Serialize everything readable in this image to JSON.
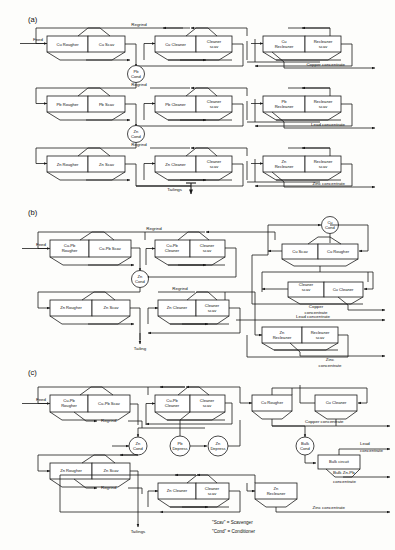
{
  "figure": {
    "panels": [
      {
        "id": "a",
        "label": "(a)"
      },
      {
        "id": "b",
        "label": "(b)"
      },
      {
        "id": "c",
        "label": "(c)"
      }
    ],
    "legend": [
      {
        "term": "\"Scav\" = Scavenger"
      },
      {
        "term": "\"Cond\" = Conditioner"
      }
    ]
  },
  "panel_a": {
    "label": "(a)",
    "feed": "Feed",
    "rows": [
      {
        "regrind": "Regrind",
        "rougher": "Cu Rougher",
        "scav": "Cu Scav",
        "cleaner": "Cu Cleaner",
        "cleaner_scav_l1": "Cleaner",
        "cleaner_scav_l2": "scav",
        "recleaner_l1": "Cu",
        "recleaner_l2": "Recleaner",
        "recleaner_scav_l1": "Recleaner",
        "recleaner_scav_l2": "scav",
        "product": "Copper concentrate",
        "conditioner_l1": "Pb",
        "conditioner_l2": "Cond"
      },
      {
        "regrind": "Regrind",
        "rougher": "Pb Rougher",
        "scav": "Pb Scav",
        "cleaner": "Pb Cleaner",
        "cleaner_scav_l1": "Cleaner",
        "cleaner_scav_l2": "scav",
        "recleaner_l1": "Pb",
        "recleaner_l2": "Recleaner",
        "recleaner_scav_l1": "Recleaner",
        "recleaner_scav_l2": "scav",
        "product": "Lead concentrate",
        "conditioner_l1": "Zn",
        "conditioner_l2": "Cond"
      },
      {
        "regrind": "Regrind",
        "rougher": "Zn Rougher",
        "scav": "Zn Scav",
        "cleaner": "Zn Cleaner",
        "cleaner_scav_l1": "Cleaner",
        "cleaner_scav_l2": "scav",
        "recleaner_l1": "Zn",
        "recleaner_l2": "Recleaner",
        "recleaner_scav_l1": "Recleaner",
        "recleaner_scav_l2": "scav",
        "product": "Zinc concentrate",
        "conditioner_l1": "",
        "conditioner_l2": ""
      }
    ],
    "tailings": "Tailings"
  },
  "panel_b": {
    "label": "(b)",
    "feed": "Feed",
    "regrind_top": "Regrind",
    "regrind_mid": "Regrind",
    "bulk_rougher_l1": "Cu-Pb",
    "bulk_rougher_l2": "Rougher",
    "bulk_scav": "Cu-Pb Scav",
    "bulk_cleaner_l1": "Cu-Pb",
    "bulk_cleaner_l2": "Cleaner",
    "bulk_cleaner_scav_l1": "Cleaner",
    "bulk_cleaner_scav_l2": "scav",
    "zn_cond_l1": "Zn",
    "zn_cond_l2": "Cond",
    "cu_cond_l1": "Cu",
    "cu_cond_l2": "Cond",
    "cu_scav": "Cu Scav",
    "cu_rougher": "Cu Rougher",
    "cu_cleaner_scav_l1": "Cleaner",
    "cu_cleaner_scav_l2": "scav",
    "cu_cleaner": "Cu Cleaner",
    "copper_conc_l1": "Copper",
    "copper_conc_l2": "concentrate",
    "lead_conc": "Lead concentrate",
    "zn_rougher": "Zn Rougher",
    "zn_scav": "Zn Scav",
    "zn_cleaner": "Zn Cleaner",
    "zn_cleaner_scav_l1": "Cleaner",
    "zn_cleaner_scav_l2": "scav",
    "zn_recleaner_l1": "Zn",
    "zn_recleaner_l2": "Recleaner",
    "zn_recleaner_scav_l1": "Recleaner",
    "zn_recleaner_scav_l2": "scav",
    "zinc_conc_l1": "Zinc",
    "zinc_conc_l2": "concentrate",
    "tailing": "Tailing"
  },
  "panel_c": {
    "label": "(c)",
    "feed": "Feed",
    "bulk_rougher_l1": "Cu-Pb",
    "bulk_rougher_l2": "Rougher",
    "bulk_scav": "Cu-Pb Scav",
    "regrind_top": "Regrind",
    "bulk_cleaner_l1": "Cu-Pb",
    "bulk_cleaner_l2": "Cleaner",
    "bulk_cleaner_scav_l1": "Cleaner",
    "bulk_cleaner_scav_l2": "scav",
    "cu_rougher": "Cu Rougher",
    "cu_cleaner": "Cu Cleaner",
    "zn_cond_l1": "Zn",
    "zn_cond_l2": "Cond",
    "pb_depress_l1": "Pb",
    "pb_depress_l2": "Depress",
    "zn_depress_l1": "Zn",
    "zn_depress_l2": "Depress",
    "bulk_cond_l1": "Bulk",
    "bulk_cond_l2": "Cond",
    "bulk_circuit": "Bulk circuit",
    "copper_conc": "Copper concentrate",
    "lead_conc_l1": "Lead",
    "lead_conc_l2": "concentrate",
    "bulk_conc_l1": "Bulk Zn-Pb",
    "bulk_conc_l2": "concentrate",
    "zn_rougher": "Zn Rougher",
    "zn_scav": "Zn Scav",
    "regrind_low": "Regrind",
    "zn_cleaner": "Zn Cleaner",
    "zn_cleaner_scav_l1": "Cleaner",
    "zn_cleaner_scav_l2": "scav",
    "zn_recleaner_l1": "Zn",
    "zn_recleaner_l2": "Recleaner",
    "zinc_conc": "Zinc concentrate",
    "tailings": "Tailings",
    "legend_scav": "\"Scav\" = Scavenger",
    "legend_cond": "\"Cond\" = Conditioner"
  }
}
